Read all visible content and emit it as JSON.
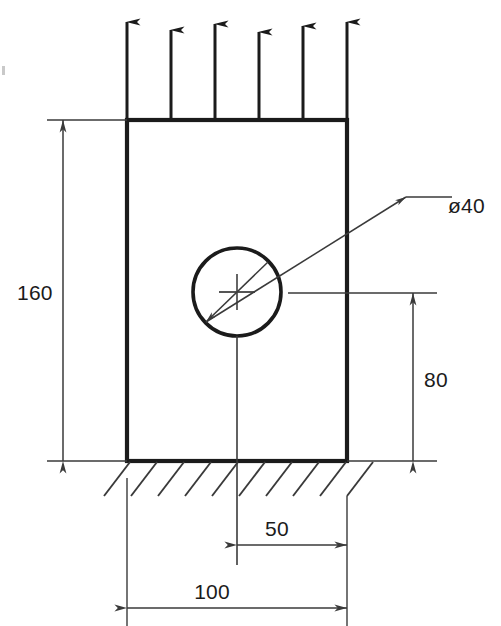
{
  "drawing": {
    "title": "Rectangular plate with central circular hole under uniform tensile load",
    "units": "mm",
    "line_color": "#1b1b1b",
    "dimension_color": "#3a3a3a",
    "background": "#ffffff"
  },
  "plate": {
    "name": "rectangular-plate",
    "width_label": "100",
    "height_label": "160",
    "left_px": 127,
    "right_px": 347,
    "top_px": 120,
    "bottom_px": 461,
    "outline_stroke_px": 4
  },
  "hole": {
    "name": "circular-hole",
    "diameter_label": "ø40",
    "center_x_px": 237,
    "center_y_px": 292,
    "radius_px": 44,
    "stroke_px": 3.4,
    "center_mark": "crosshair"
  },
  "load": {
    "name": "distributed-tensile-load",
    "arrow_count": 6,
    "arrow_x_positions": [
      127,
      171,
      215,
      259,
      303,
      347
    ],
    "arrow_tip_y_px": 16,
    "arrow_base_y_px": 120,
    "direction": "up"
  },
  "support": {
    "name": "fixed-ground-support",
    "hatch_count": 10,
    "hatch_start_x_px": 104,
    "hatch_spacing_px": 27,
    "hatch_baseline_y_px": 462,
    "hatch_depth_px": 34,
    "hatch_dx_px": -26
  },
  "dimensions": [
    {
      "id": "dim-height-160",
      "name": "dimension-height-160",
      "label": "160",
      "orientation": "vertical",
      "line_x_px": 63,
      "from_y_px": 120,
      "to_y_px": 461,
      "text_x_px": 17,
      "text_y_px": 300,
      "ext_from_x_px": 47,
      "ext_to_x_px": 127
    },
    {
      "id": "dim-hole-height-80",
      "name": "dimension-hole-height-80",
      "label": "80",
      "orientation": "vertical",
      "line_x_px": 413,
      "from_y_px": 293,
      "to_y_px": 461,
      "text_x_px": 424,
      "text_y_px": 387,
      "ext_from_x_px": 290,
      "ext_to_x_px": 437
    },
    {
      "id": "dim-hole-offset-50",
      "name": "dimension-hole-offset-50",
      "label": "50",
      "orientation": "horizontal",
      "line_y_px": 545,
      "from_x_px": 237,
      "to_x_px": 347,
      "text_x_px": 277,
      "text_y_px": 536
    },
    {
      "id": "dim-width-100",
      "name": "dimension-width-100",
      "label": "100",
      "orientation": "horizontal",
      "line_y_px": 608,
      "from_x_px": 127,
      "to_x_px": 347,
      "text_x_px": 212,
      "text_y_px": 599
    }
  ],
  "leader": {
    "name": "diameter-leader",
    "label": "ø40",
    "arrow_a_x_px": 206,
    "arrow_a_y_px": 322,
    "arrow_b_x_px": 268,
    "arrow_b_y_px": 262,
    "elbow_x_px": 406,
    "elbow_y_px": 197,
    "shelf_end_x_px": 452,
    "text_x_px": 448,
    "text_y_px": 205
  }
}
